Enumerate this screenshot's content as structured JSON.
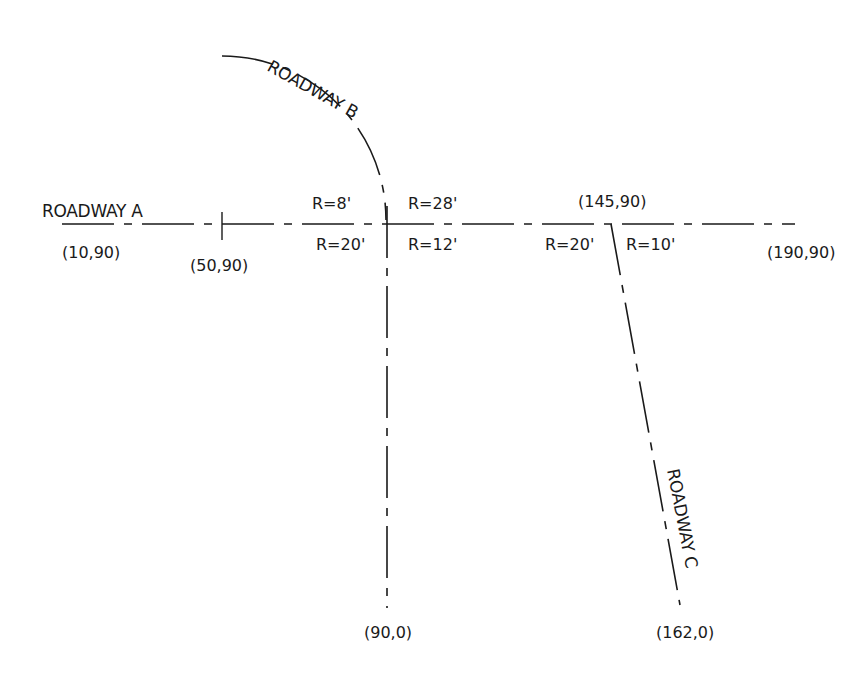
{
  "roadways": {
    "a": {
      "name": "ROADWAY A",
      "start": "(10,90)",
      "mid": "(50,90)",
      "end": "(190,90)"
    },
    "b": {
      "name": "ROADWAY B",
      "end": "(90,0)"
    },
    "c": {
      "name": "ROADWAY C",
      "intersection": "(145,90)",
      "end": "(162,0)"
    }
  },
  "radii": {
    "b_upper_left": "R=8'",
    "b_upper_right": "R=28'",
    "b_lower_left": "R=20'",
    "b_lower_right": "R=12'",
    "c_left": "R=20'",
    "c_right": "R=10'"
  },
  "colors": {
    "line": "#1a1a1a",
    "background": "#ffffff"
  }
}
